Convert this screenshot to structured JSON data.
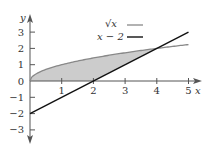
{
  "chart_data": {
    "type": "line",
    "title": "",
    "xlabel": "x",
    "ylabel": "y",
    "xlim": [
      0,
      5.3
    ],
    "ylim": [
      -3.3,
      3.3
    ],
    "x_ticks": [
      "1",
      "2",
      "3",
      "4",
      "5"
    ],
    "y_ticks": [
      "3",
      "2",
      "1",
      "0",
      "-1",
      "-2",
      "-3"
    ],
    "grid": false,
    "legend_position": "top-right",
    "series": [
      {
        "name": "√x",
        "color": "#888888",
        "x": [
          0,
          0.25,
          0.5,
          1,
          1.5,
          2,
          2.5,
          3,
          3.5,
          4,
          4.5,
          5
        ],
        "values": [
          0,
          0.5,
          0.707,
          1,
          1.225,
          1.414,
          1.581,
          1.732,
          1.871,
          2,
          2.121,
          2.236
        ]
      },
      {
        "name": "x − 2",
        "color": "#111111",
        "x": [
          0,
          1,
          2,
          3,
          4,
          5
        ],
        "values": [
          -2,
          -1,
          0,
          1,
          2,
          3
        ]
      }
    ],
    "annotations": [
      {
        "type": "shaded-region",
        "description": "area between √x (above) and max(0, x−2) (below) from x=0 to x=4",
        "color": "#cccccc"
      },
      {
        "type": "intersection",
        "x": 4,
        "y": 2
      }
    ]
  },
  "legend": {
    "items": [
      {
        "label": "√x",
        "color": "#888888"
      },
      {
        "label": "x − 2",
        "color": "#111111"
      }
    ]
  },
  "axes": {
    "x_label": "x",
    "y_label": "y",
    "x_tick_labels": [
      "1",
      "2",
      "3",
      "4",
      "5"
    ],
    "y_tick_labels": [
      "3",
      "2",
      "1",
      "0",
      "−1",
      "−2",
      "−3"
    ]
  }
}
